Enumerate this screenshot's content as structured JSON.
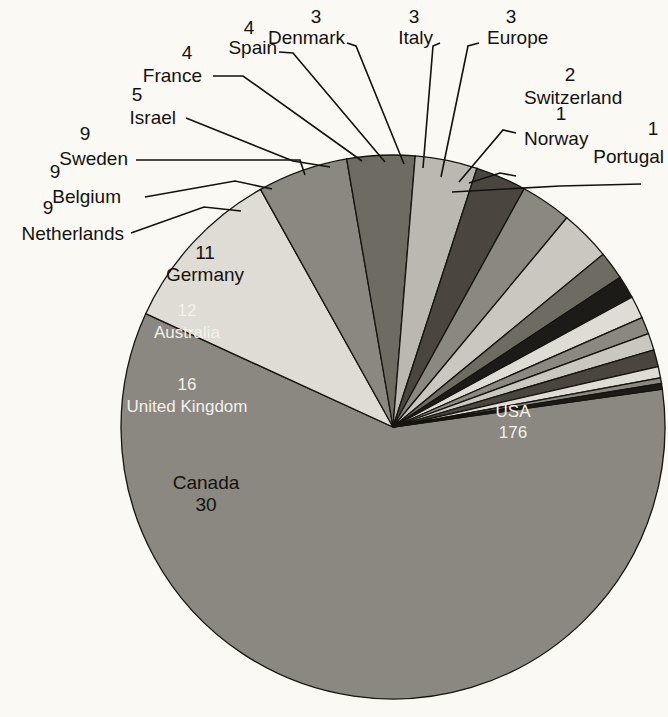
{
  "chart_data": {
    "type": "pie",
    "title": "",
    "subtitle": "",
    "xlabel": "",
    "ylabel": "",
    "legend_position": "callout-labels",
    "grid": false,
    "total": 298,
    "value_suffix": "",
    "categories": [
      "USA",
      "Canada",
      "United Kingdom",
      "Australia",
      "Germany",
      "Netherlands",
      "Belgium",
      "Sweden",
      "Israel",
      "France",
      "Spain",
      "Denmark",
      "Italy",
      "Europe",
      "Switzerland",
      "Norway",
      "Portugal"
    ],
    "values": [
      176,
      30,
      16,
      12,
      11,
      9,
      9,
      9,
      5,
      4,
      4,
      3,
      3,
      3,
      2,
      1,
      1
    ],
    "slices": [
      {
        "name": "USA",
        "value": 176,
        "color": "#8a8880",
        "label_placement": "inside",
        "label_color": "#f2f1ec"
      },
      {
        "name": "Canada",
        "value": 30,
        "color": "#dedcd4",
        "label_placement": "inside",
        "label_color": "#14120f"
      },
      {
        "name": "United Kingdom",
        "value": 16,
        "color": "#8a8880",
        "label_placement": "inside",
        "label_color": "#f2f1ec"
      },
      {
        "name": "Australia",
        "value": 12,
        "color": "#6e6b63",
        "label_placement": "inside",
        "label_color": "#f2f1ec"
      },
      {
        "name": "Germany",
        "value": 11,
        "color": "#bab8b0",
        "label_placement": "inside",
        "label_color": "#14120f"
      },
      {
        "name": "Netherlands",
        "value": 9,
        "color": "#4a463f",
        "label_placement": "callout",
        "label_color": "#14120f"
      },
      {
        "name": "Belgium",
        "value": 9,
        "color": "#8a8880",
        "label_placement": "callout",
        "label_color": "#14120f"
      },
      {
        "name": "Sweden",
        "value": 9,
        "color": "#c9c7bf",
        "label_placement": "callout",
        "label_color": "#14120f"
      },
      {
        "name": "Israel",
        "value": 5,
        "color": "#6e6b63",
        "label_placement": "callout",
        "label_color": "#14120f"
      },
      {
        "name": "France",
        "value": 4,
        "color": "#1d1b17",
        "label_placement": "callout",
        "label_color": "#14120f"
      },
      {
        "name": "Spain",
        "value": 4,
        "color": "#dedcd4",
        "label_placement": "callout",
        "label_color": "#14120f"
      },
      {
        "name": "Denmark",
        "value": 3,
        "color": "#8a8880",
        "label_placement": "callout",
        "label_color": "#14120f"
      },
      {
        "name": "Italy",
        "value": 3,
        "color": "#c9c7bf",
        "label_placement": "callout",
        "label_color": "#14120f"
      },
      {
        "name": "Europe",
        "value": 3,
        "color": "#4a463f",
        "label_placement": "callout",
        "label_color": "#14120f"
      },
      {
        "name": "Switzerland",
        "value": 2,
        "color": "#dedcd4",
        "label_placement": "callout",
        "label_color": "#14120f"
      },
      {
        "name": "Norway",
        "value": 1,
        "color": "#8a8880",
        "label_placement": "callout",
        "label_color": "#14120f"
      },
      {
        "name": "Portugal",
        "value": 1,
        "color": "#1d1b17",
        "label_placement": "callout",
        "label_color": "#14120f"
      }
    ]
  },
  "callouts": {
    "portugal": {
      "value": "1",
      "name": "Portugal"
    },
    "norway": {
      "value": "1",
      "name": "Norway"
    },
    "switzerland": {
      "value": "2",
      "name": "Switzerland"
    },
    "europe": {
      "value": "3",
      "name": "Europe"
    },
    "italy": {
      "value": "3",
      "name": "Italy"
    },
    "denmark": {
      "value": "3",
      "name": "Denmark"
    },
    "spain": {
      "value": "4",
      "name": "Spain"
    },
    "france": {
      "value": "4",
      "name": "France"
    },
    "israel": {
      "value": "5",
      "name": "Israel"
    },
    "sweden": {
      "value": "9",
      "name": "Sweden"
    },
    "belgium": {
      "value": "9",
      "name": "Belgium"
    },
    "netherlands": {
      "value": "9",
      "name": "Netherlands"
    }
  },
  "inside_labels": {
    "germany": {
      "value": "11",
      "name": "Germany"
    },
    "australia": {
      "value": "12",
      "name": "Australia"
    },
    "united_kingdom": {
      "value": "16",
      "name": "United Kingdom"
    },
    "canada": {
      "name": "Canada",
      "value": "30"
    },
    "usa": {
      "name": "USA",
      "value": "176"
    }
  },
  "colors": {
    "background": "#faf9f4",
    "outline": "#16140f",
    "text_dark": "#14120f",
    "text_light": "#f2f1ec"
  }
}
